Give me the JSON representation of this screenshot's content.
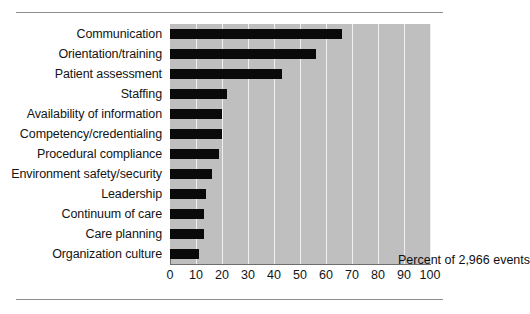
{
  "chart_data": {
    "type": "bar",
    "orientation": "horizontal",
    "title": "",
    "xlabel": "",
    "ylabel": "",
    "annotation": "Percent of 2,966 events",
    "xlim": [
      0,
      100
    ],
    "xticks": [
      0,
      10,
      20,
      30,
      40,
      50,
      60,
      70,
      80,
      90,
      100
    ],
    "xtick_labels": [
      "0",
      "10",
      "20",
      "30",
      "40",
      "50",
      "60",
      "70",
      "80",
      "90",
      "100"
    ],
    "grid": true,
    "grid_axis": "x",
    "legend": "none",
    "plot_background": "#bfbfbf",
    "bar_color": "#0a0a0a",
    "gridline_color": "#f0f0f0",
    "categories": [
      "Communication",
      "Orientation/training",
      "Patient assessment",
      "Staffing",
      "Availability of information",
      "Competency/credentialing",
      "Procedural compliance",
      "Environment safety/security",
      "Leadership",
      "Continuum of care",
      "Care planning",
      "Organization culture"
    ],
    "values": [
      66,
      56,
      43,
      22,
      20,
      20,
      19,
      16,
      14,
      13,
      13,
      11
    ]
  }
}
